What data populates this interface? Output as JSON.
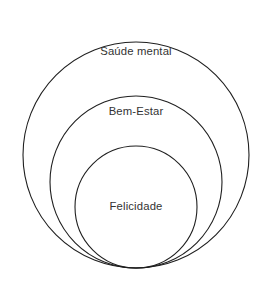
{
  "diagram": {
    "type": "nested-circles",
    "background_color": "#ffffff",
    "stroke_color": "#1f1f1f",
    "text_color": "#333333",
    "circles": [
      {
        "name": "outer",
        "label": "Saúde mental",
        "cx": 136,
        "cy": 155,
        "r": 113,
        "label_x": 136,
        "label_y": 52
      },
      {
        "name": "middle",
        "label": "Bem-Estar",
        "cx": 136,
        "cy": 182,
        "r": 86,
        "label_x": 136,
        "label_y": 112
      },
      {
        "name": "inner",
        "label": "Felicidade",
        "cx": 136,
        "cy": 207,
        "r": 61,
        "label_x": 136,
        "label_y": 207
      }
    ]
  }
}
